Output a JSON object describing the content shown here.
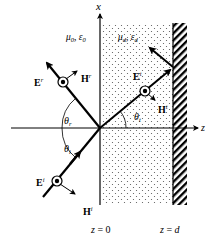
{
  "diagram": {
    "axes": {
      "x_label": "x",
      "z_label": "z"
    },
    "regions": {
      "medium0": {
        "mu": "μ",
        "mu_sub": "0",
        "sep": ", ",
        "eps": "ε",
        "eps_sub": "0"
      },
      "medium_d": {
        "mu": "μ",
        "mu_sub": "d",
        "sep": ", ",
        "eps": "ε",
        "eps_sub": "d"
      }
    },
    "boundaries": {
      "z0": {
        "var": "z",
        "eq": " = 0"
      },
      "zd": {
        "var": "z",
        "eq": " = ",
        "val": "d"
      }
    },
    "waves": {
      "incident": {
        "E": "E",
        "E_sup": "i",
        "H": "H",
        "H_sup": "i",
        "angle": "θ",
        "angle_sub": "i"
      },
      "reflected": {
        "E": "E",
        "E_sup": "r",
        "H": "H",
        "H_sup": "r",
        "angle": "θ",
        "angle_sub": "r"
      },
      "transmitted": {
        "E": "E",
        "E_sup": "t",
        "H": "H",
        "H_sup": "t",
        "angle": "θ",
        "angle_sub": "t"
      }
    },
    "colors": {
      "ink": "#000000",
      "background": "#ffffff",
      "dots": "#555555"
    }
  }
}
